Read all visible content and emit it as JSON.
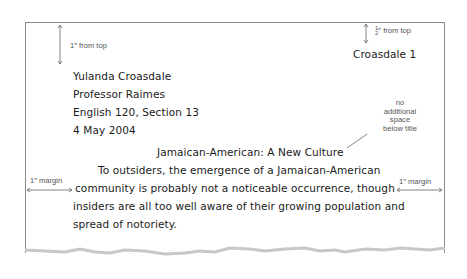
{
  "document": {
    "header": "Croasdale 1",
    "heading_lines": [
      "Yulanda Croasdale",
      "Professor Raimes",
      "English 120, Section 13",
      "4 May 2004"
    ],
    "title": "Jamaican-American: A New Culture",
    "body_lines": [
      "To outsiders, the emergence of a Jamaican-American",
      "community is probably not a noticeable occurrence, though",
      "insiders are all too well aware of their growing population and",
      "spread of notoriety."
    ]
  },
  "annotations": {
    "top_margin": "1″ from top",
    "header_margin_num": "1",
    "header_margin_den": "2",
    "header_margin_suffix": "″ from top",
    "title_note": [
      "no",
      "additional",
      "space",
      "below title"
    ],
    "left_margin": "1″ margin",
    "right_margin": "1″ margin"
  },
  "colors": {
    "annotation": "#555555",
    "page_border": "#8a8a8a",
    "text": "#1a1a1a"
  }
}
